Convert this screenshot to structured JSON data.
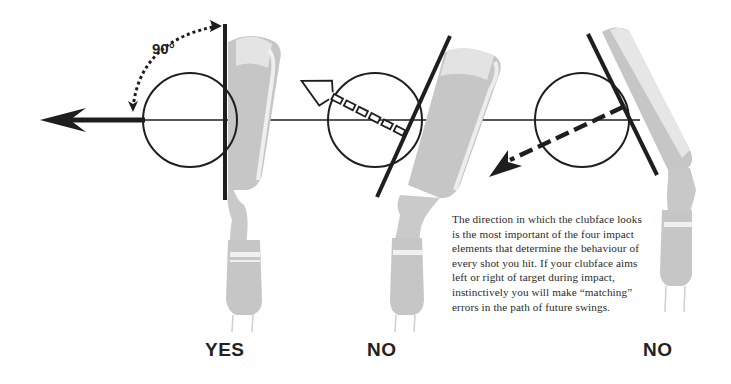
{
  "figure": {
    "angle_label": "90°",
    "panels": [
      {
        "id": "square",
        "verdict": "YES",
        "face": "square (perpendicular to target line)",
        "ball_flight_arrow": "solid, straight left along target line"
      },
      {
        "id": "open",
        "verdict": "NO",
        "face": "open",
        "ball_flight_arrow": "hollow dashed, up-left"
      },
      {
        "id": "closed",
        "verdict": "NO",
        "face": "closed",
        "ball_flight_arrow": "dashed, down-left"
      }
    ],
    "caption": "The direction in which the clubface looks is the most important of the four impact elements that determine the behaviour of every shot you hit. If your clubface aims left or right of target during impact, instinctively you will make “matching” errors in the path of future swings.",
    "colors": {
      "ink": "#1e1e1e",
      "club_gray": "#c4c4c4",
      "club_light": "#e2e2e2",
      "background": "#ffffff"
    }
  }
}
